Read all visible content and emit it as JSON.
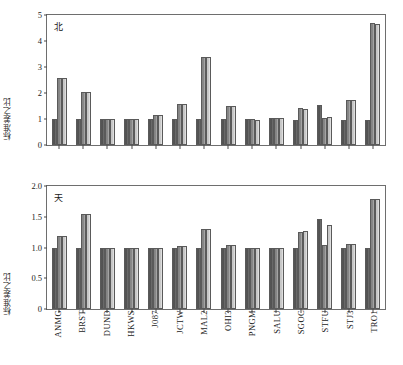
{
  "chart_data": {
    "type": "bar",
    "title": "",
    "categories": [
      "ANMG",
      "BRST",
      "DUND",
      "HKWS",
      "J087",
      "JCTW",
      "MAL2",
      "OHI3",
      "PNGM",
      "SALU",
      "SGOC",
      "STFU",
      "STJ3",
      "TRO1"
    ],
    "panels": [
      {
        "tag": "北",
        "ylabel": "标准差之比",
        "ylim": [
          0,
          5
        ],
        "yticks": [
          "0",
          "1",
          "2",
          "3",
          "4",
          "5"
        ],
        "ytick_values": [
          0,
          1,
          2,
          3,
          4,
          5
        ],
        "grid": false,
        "series": [
          {
            "name": "series-1-dark",
            "values": [
              1.0,
              1.0,
              1.0,
              1.0,
              1.0,
              1.0,
              1.0,
              1.0,
              1.0,
              1.02,
              0.97,
              1.52,
              0.98,
              0.98
            ]
          },
          {
            "name": "series-2-medium",
            "values": [
              2.58,
              2.04,
              1.01,
              1.0,
              1.15,
              1.59,
              3.37,
              1.51,
              0.99,
              1.03,
              1.41,
              1.05,
              1.75,
              4.68
            ]
          },
          {
            "name": "series-3-light",
            "values": [
              2.58,
              2.04,
              1.01,
              0.99,
              1.15,
              1.59,
              3.37,
              1.51,
              0.98,
              1.03,
              1.4,
              1.06,
              1.75,
              4.65
            ]
          }
        ]
      },
      {
        "tag": "天",
        "ylabel": "标准差之比",
        "ylim": [
          0,
          2.0
        ],
        "yticks": [
          "0",
          "0.5",
          "1.0",
          "1.5",
          "2.0"
        ],
        "ytick_values": [
          0,
          0.5,
          1.0,
          1.5,
          2.0
        ],
        "grid": false,
        "series": [
          {
            "name": "series-1-dark",
            "values": [
              0.99,
              1.0,
              1.0,
              1.0,
              1.0,
              1.0,
              1.0,
              0.99,
              1.0,
              0.99,
              0.99,
              1.47,
              0.99,
              0.99
            ]
          },
          {
            "name": "series-2-medium",
            "values": [
              1.18,
              1.54,
              1.0,
              1.0,
              1.0,
              1.02,
              1.3,
              1.04,
              1.0,
              1.0,
              1.26,
              1.04,
              1.05,
              1.79
            ]
          },
          {
            "name": "series-3-light",
            "values": [
              1.18,
              1.54,
              1.0,
              1.0,
              1.0,
              1.03,
              1.3,
              1.04,
              1.0,
              1.0,
              1.27,
              1.37,
              1.06,
              1.79
            ]
          }
        ]
      }
    ]
  }
}
